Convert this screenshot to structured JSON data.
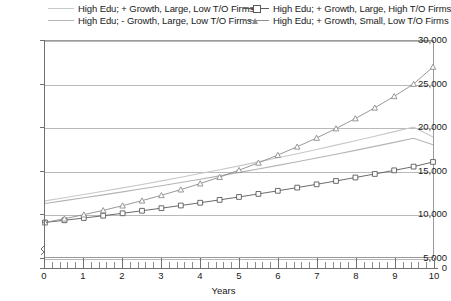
{
  "chart_data": {
    "type": "line",
    "title": "",
    "xlabel": "Years",
    "ylabel": "",
    "xlim": [
      0,
      10
    ],
    "ylim": [
      5000,
      30000
    ],
    "grid": true,
    "legend_position": "top",
    "y_axis_break": true,
    "y_ticks": [
      {
        "value": 0,
        "label": "0"
      },
      {
        "value": 5000,
        "label": "5,000"
      },
      {
        "value": 10000,
        "label": "10,000"
      },
      {
        "value": 15000,
        "label": "15,000"
      },
      {
        "value": 20000,
        "label": "20,000"
      },
      {
        "value": 25000,
        "label": "25,000"
      },
      {
        "value": 30000,
        "label": "30,000"
      }
    ],
    "x_ticks": [
      "0",
      "1",
      "2",
      "3",
      "4",
      "5",
      "6",
      "7",
      "8",
      "9",
      "10"
    ],
    "x_minor_ticks_per_major": 5,
    "x": [
      0,
      0.5,
      1,
      1.5,
      2,
      2.5,
      3,
      3.5,
      4,
      4.5,
      5,
      5.5,
      6,
      6.5,
      7,
      7.5,
      8,
      8.5,
      9,
      9.5,
      10
    ],
    "series": [
      {
        "name": "High Edu; + Growth, Large, Low T/O Firms",
        "color": "#c8c8c8",
        "marker": "none",
        "values": [
          11500,
          11860,
          12230,
          12610,
          13000,
          13400,
          13810,
          14230,
          14660,
          15100,
          15550,
          16010,
          16480,
          16960,
          17450,
          17950,
          18460,
          18980,
          19510,
          20050,
          18900
        ]
      },
      {
        "name": "High Edu; - Growth, Large, Low T/O Firms",
        "color": "#b4b4b4",
        "marker": "none",
        "values": [
          11200,
          11520,
          11850,
          12190,
          12540,
          12890,
          13250,
          13620,
          14000,
          14390,
          14790,
          15190,
          15600,
          16020,
          16450,
          16890,
          17340,
          17800,
          18270,
          18750,
          18000
        ]
      },
      {
        "name": "High Edu; + Growth, Large, High T/O Firms",
        "color": "#5a5a5a",
        "marker": "square",
        "values": [
          9000,
          9250,
          9510,
          9780,
          10060,
          10350,
          10650,
          10960,
          11280,
          11610,
          11950,
          12300,
          12660,
          13030,
          13410,
          13800,
          14200,
          14610,
          15030,
          15460,
          16000
        ]
      },
      {
        "name": "High Edu; + Growth, Small, Low T/O Firms",
        "color": "#8c8c8c",
        "marker": "triangle",
        "values": [
          9000,
          9430,
          9900,
          10400,
          10940,
          11520,
          12140,
          12800,
          13500,
          14250,
          15050,
          15900,
          16800,
          17760,
          18780,
          19870,
          21030,
          22270,
          23600,
          25020,
          27000
        ]
      }
    ]
  }
}
